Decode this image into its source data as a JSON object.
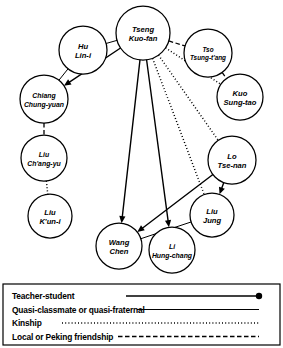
{
  "diagram": {
    "background_color": "#ffffff",
    "line_color": "#000000",
    "node_fill": "#ffffff",
    "nodes": [
      {
        "id": "tseng",
        "label_line1": "Tseng",
        "label_line2": "Kuo-fan",
        "cx": 143,
        "cy": 33,
        "r": 27
      },
      {
        "id": "hu",
        "label_line1": "Hu",
        "label_line2": "Lin-i",
        "cx": 83,
        "cy": 50,
        "r": 24
      },
      {
        "id": "tso",
        "label_line1": "Tso",
        "label_line2": "Tsung-t'ang",
        "cx": 208,
        "cy": 53,
        "r": 24
      },
      {
        "id": "kuo",
        "label_line1": "Kuo",
        "label_line2": "Sung-tao",
        "cx": 240,
        "cy": 97,
        "r": 23
      },
      {
        "id": "chiang",
        "label_line1": "Chiang",
        "label_line2": "Chung-yuan",
        "cx": 44,
        "cy": 99,
        "r": 24
      },
      {
        "id": "liuc",
        "label_line1": "Liu",
        "label_line2": "Ch'ang-yu",
        "cx": 44,
        "cy": 158,
        "r": 23
      },
      {
        "id": "liuk",
        "label_line1": "Liu",
        "label_line2": "K'un-i",
        "cx": 50,
        "cy": 216,
        "r": 22
      },
      {
        "id": "lo",
        "label_line1": "Lo",
        "label_line2": "Tse-nan",
        "cx": 232,
        "cy": 160,
        "r": 24
      },
      {
        "id": "liuj",
        "label_line1": "Liu",
        "label_line2": "Jung",
        "cx": 212,
        "cy": 215,
        "r": 22
      },
      {
        "id": "wang",
        "label_line1": "Wang",
        "label_line2": "Chen",
        "cx": 119,
        "cy": 246,
        "r": 23
      },
      {
        "id": "li",
        "label_line1": "Li",
        "label_line2": "Hung-chang",
        "cx": 172,
        "cy": 250,
        "r": 23
      }
    ],
    "edges": [
      {
        "from": "tseng",
        "to": "hu",
        "type": "quasi-classmate",
        "arrow": false
      },
      {
        "from": "tseng",
        "to": "tso",
        "type": "friendship",
        "arrow": false
      },
      {
        "from": "tso",
        "to": "kuo",
        "type": "friendship",
        "arrow": false
      },
      {
        "from": "tseng",
        "to": "kuo",
        "type": "kinship",
        "arrow": false
      },
      {
        "from": "tseng",
        "to": "chiang",
        "type": "teacher-student",
        "arrow": true
      },
      {
        "from": "hu",
        "to": "chiang",
        "type": "quasi-classmate",
        "arrow": false
      },
      {
        "from": "chiang",
        "to": "liuc",
        "type": "friendship",
        "arrow": false
      },
      {
        "from": "liuc",
        "to": "liuk",
        "type": "kinship",
        "arrow": false
      },
      {
        "from": "tseng",
        "to": "lo",
        "type": "kinship",
        "arrow": false
      },
      {
        "from": "tseng",
        "to": "liuj",
        "type": "kinship",
        "arrow": false
      },
      {
        "from": "tseng",
        "to": "wang",
        "type": "teacher-student",
        "arrow": true
      },
      {
        "from": "tseng",
        "to": "li",
        "type": "teacher-student",
        "arrow": true
      },
      {
        "from": "lo",
        "to": "liuj",
        "type": "teacher-student",
        "arrow": true
      },
      {
        "from": "lo",
        "to": "wang",
        "type": "teacher-student",
        "arrow": true
      },
      {
        "from": "liuj",
        "to": "wang",
        "type": "quasi-classmate",
        "arrow": false
      }
    ]
  },
  "legend": {
    "items": [
      {
        "label": "Teacher-student",
        "style": "teacher-student"
      },
      {
        "label": "Quasi-classmate or quasi-fraternal",
        "style": "quasi-classmate"
      },
      {
        "label": "Kinship",
        "style": "kinship"
      },
      {
        "label": "Local or Peking friendship",
        "style": "friendship"
      }
    ]
  }
}
